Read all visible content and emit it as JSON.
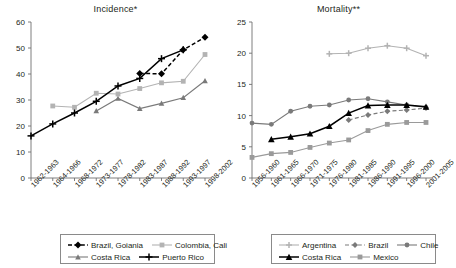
{
  "figure": {
    "panels": [
      "incidence",
      "mortality"
    ]
  },
  "chart_data": [
    {
      "id": "incidence",
      "type": "line",
      "title": "Incidence*",
      "xlabel": "",
      "ylabel": "",
      "ylim": [
        0,
        60
      ],
      "yticks": [
        0,
        10,
        20,
        30,
        40,
        50,
        60
      ],
      "grid": false,
      "legend_position": "bottom-left",
      "categories": [
        "1962-1963",
        "1964-1966",
        "1968-1972",
        "1973-1977",
        "1978-1982",
        "1983-1987",
        "1988-1992",
        "1993-1997",
        "1998-2002"
      ],
      "series": [
        {
          "name": "Brazil, Goiania",
          "color": "#000000",
          "marker": "diamond",
          "dash": "dashed",
          "values": [
            null,
            null,
            null,
            null,
            null,
            40.2,
            40.1,
            49.3,
            54.1
          ]
        },
        {
          "name": "Colombia, Cali",
          "color": "#b3b3b3",
          "marker": "square",
          "dash": "solid",
          "values": [
            null,
            27.7,
            27.2,
            32.6,
            32.3,
            34.4,
            36.6,
            37.2,
            47.5
          ]
        },
        {
          "name": "Costa Rica",
          "color": "#7a7a7a",
          "marker": "triangle",
          "dash": "solid",
          "values": [
            null,
            null,
            null,
            25.8,
            30.6,
            26.7,
            28.7,
            30.9,
            37.4
          ]
        },
        {
          "name": "Puerto Rico",
          "color": "#000000",
          "marker": "cross",
          "dash": "solid",
          "values": [
            16.2,
            20.8,
            25.0,
            29.5,
            35.4,
            38.3,
            45.9,
            49.3,
            null
          ]
        }
      ]
    },
    {
      "id": "mortality",
      "type": "line",
      "title": "Mortality**",
      "xlabel": "",
      "ylabel": "",
      "ylim": [
        0,
        25
      ],
      "yticks": [
        0,
        5,
        10,
        15,
        20,
        25
      ],
      "grid": false,
      "legend_position": "bottom-right",
      "categories": [
        "1956-1960",
        "1961-1965",
        "1966-1970",
        "1971-1975",
        "1976-1980",
        "1981-1985",
        "1986-1990",
        "1991-1995",
        "1996-2000",
        "2001-2005"
      ],
      "series": [
        {
          "name": "Argentina",
          "color": "#b3b3b3",
          "marker": "cross",
          "dash": "solid",
          "values": [
            null,
            null,
            null,
            null,
            19.9,
            20.0,
            20.8,
            21.2,
            20.8,
            19.6
          ]
        },
        {
          "name": "Brazil",
          "color": "#7a7a7a",
          "marker": "diamond",
          "dash": "dashed",
          "values": [
            null,
            null,
            null,
            null,
            null,
            9.3,
            10.1,
            10.7,
            10.9,
            11.2
          ]
        },
        {
          "name": "Chile",
          "color": "#7a7a7a",
          "marker": "circle",
          "dash": "solid",
          "values": [
            8.8,
            8.6,
            10.7,
            11.5,
            11.7,
            12.5,
            12.7,
            12.2,
            11.7,
            11.3
          ]
        },
        {
          "name": "Costa Rica",
          "color": "#000000",
          "marker": "triangle",
          "dash": "solid",
          "values": [
            null,
            6.2,
            6.6,
            7.1,
            8.3,
            10.4,
            11.6,
            11.7,
            11.7,
            11.4
          ]
        },
        {
          "name": "Mexico",
          "color": "#9a9a9a",
          "marker": "square",
          "dash": "solid",
          "values": [
            3.3,
            3.9,
            4.1,
            4.9,
            5.6,
            6.1,
            7.6,
            8.6,
            8.9,
            8.9
          ]
        }
      ]
    }
  ]
}
